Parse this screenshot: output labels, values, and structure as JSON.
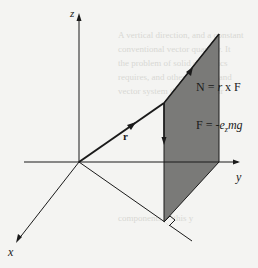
{
  "diagram": {
    "axes": {
      "x_label": "x",
      "y_label": "y",
      "z_label": "z"
    },
    "vectors": {
      "position_label": "r",
      "torque_equation": "N = r x F",
      "torque_lhs": "N = ",
      "torque_r": "r",
      "torque_rest": " x F",
      "force_equation": "F = -e_z mg",
      "force_lhs": "F = -",
      "force_e": "e",
      "force_sub": "z",
      "force_mg": "mg"
    },
    "shaded_plane": "plane containing r and F",
    "right_angle_marker": true,
    "colors": {
      "background": "#f4f4f2",
      "lines": "#1a1a1a",
      "plane_fill": "#7a7a78"
    }
  }
}
